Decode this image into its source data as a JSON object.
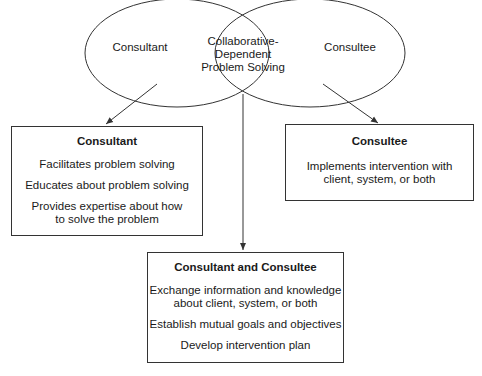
{
  "venn": {
    "left_label": "Consultant",
    "center_label": "Collaborative-\nDependent\nProblem Solving",
    "right_label": "Consultee"
  },
  "boxes": {
    "consultant": {
      "title": "Consultant",
      "items": [
        "Facilitates problem solving",
        "Educates about problem solving",
        "Provides expertise about how\nto solve the problem"
      ]
    },
    "consultee": {
      "title": "Consultee",
      "items": [
        "Implements intervention with\nclient, system, or both"
      ]
    },
    "both": {
      "title": "Consultant and Consultee",
      "items": [
        "Exchange information and knowledge\nabout client, system, or both",
        "Establish mutual goals and objectives",
        "Develop intervention plan"
      ]
    }
  },
  "colors": {
    "line": "#333333",
    "text": "#1a1a1a",
    "background": "#ffffff"
  }
}
